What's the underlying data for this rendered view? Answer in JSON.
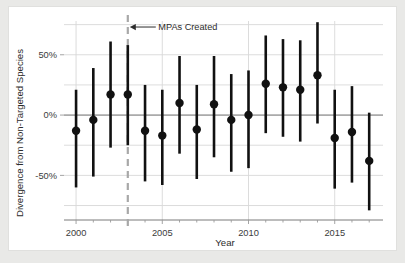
{
  "figure": {
    "background_color": "#ffffff",
    "page_color": "#e9e9e7",
    "point_color": "#111111",
    "grid_color": "#d8d8d8",
    "mpa_line_color": "#a8a8a8"
  },
  "chart_data": {
    "type": "scatter",
    "title": "",
    "xlabel": "Year",
    "ylabel": "Divergence  from Non-Targeted Species",
    "xlim": [
      1999.3,
      2017.8
    ],
    "ylim": [
      -87,
      78
    ],
    "grid": true,
    "legend_position": "none",
    "x_tick_labels": [
      "2000",
      "2005",
      "2010",
      "2015"
    ],
    "x_ticks": [
      2000,
      2005,
      2010,
      2015
    ],
    "x_minor_ticks": [
      2001,
      2002,
      2003,
      2004,
      2006,
      2007,
      2008,
      2009,
      2011,
      2012,
      2013,
      2014,
      2016,
      2017
    ],
    "y_tick_labels": [
      "50%",
      "0%",
      "-50%"
    ],
    "y_ticks": [
      50,
      0,
      -50
    ],
    "y_gridlines": [
      75,
      50,
      25,
      0,
      -25,
      -50,
      -75
    ],
    "annotations": [
      {
        "text": "MPAs Created",
        "x": 2003,
        "y": 73,
        "arrow": "left",
        "points_to_x": 2003
      }
    ],
    "reference_lines": [
      {
        "orientation": "vertical",
        "x": 2003,
        "style": "dashed",
        "label": "MPAs Created"
      },
      {
        "orientation": "horizontal",
        "y": 0,
        "style": "solid",
        "label": "zero"
      }
    ],
    "x": [
      2000,
      2001,
      2002,
      2003,
      2004,
      2005,
      2006,
      2007,
      2008,
      2009,
      2010,
      2011,
      2012,
      2013,
      2014,
      2015,
      2016,
      2017
    ],
    "series": [
      {
        "name": "Divergence from Non-Targeted Species",
        "values": [
          -13,
          -4,
          17,
          17,
          -13,
          -17,
          10,
          -12,
          9,
          -4,
          0,
          26,
          23,
          21,
          33,
          -19,
          -14,
          -38
        ],
        "ci_upper": [
          21,
          39,
          61,
          58,
          25,
          21,
          49,
          25,
          49,
          34,
          37,
          66,
          63,
          62,
          77,
          21,
          24,
          2
        ],
        "ci_lower": [
          -60,
          -51,
          -27,
          -25,
          -55,
          -58,
          -32,
          -53,
          -35,
          -47,
          -44,
          -15,
          -18,
          -22,
          -7,
          -61,
          -56,
          -79
        ]
      }
    ]
  }
}
